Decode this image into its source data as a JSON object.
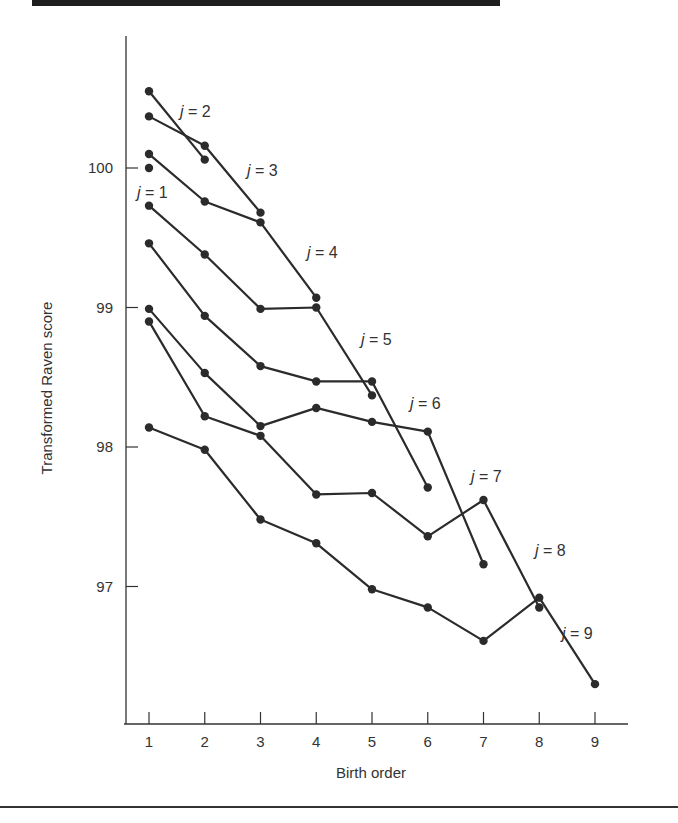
{
  "chart_data": {
    "type": "line",
    "title": "",
    "xlabel": "Birth order",
    "ylabel": "Transformed Raven score",
    "x": [
      1,
      2,
      3,
      4,
      5,
      6,
      7,
      8,
      9
    ],
    "xticks": [
      "1",
      "2",
      "3",
      "4",
      "5",
      "6",
      "7",
      "8",
      "9"
    ],
    "yticks": [
      "97",
      "98",
      "99",
      "100"
    ],
    "ytick_values": [
      97,
      98,
      99,
      100
    ],
    "ylim": [
      96.0,
      100.8
    ],
    "xlim": [
      0.6,
      9.6
    ],
    "grid": false,
    "legend": "none (series labeled inline)",
    "series": [
      {
        "name": "j = 1",
        "x": [
          1
        ],
        "values": [
          100.0
        ]
      },
      {
        "name": "j = 2",
        "x": [
          1,
          2
        ],
        "values": [
          100.55,
          100.06
        ]
      },
      {
        "name": "j = 3",
        "x": [
          1,
          2,
          3
        ],
        "values": [
          100.37,
          100.16,
          99.68
        ]
      },
      {
        "name": "j = 4",
        "x": [
          1,
          2,
          3,
          4
        ],
        "values": [
          100.1,
          99.76,
          99.61,
          99.07
        ]
      },
      {
        "name": "j = 5",
        "x": [
          1,
          2,
          3,
          4,
          5
        ],
        "values": [
          99.73,
          99.38,
          98.99,
          99.0,
          98.37
        ]
      },
      {
        "name": "j = 6",
        "x": [
          1,
          2,
          3,
          4,
          5,
          6
        ],
        "values": [
          99.46,
          98.94,
          98.58,
          98.47,
          98.47,
          97.71
        ]
      },
      {
        "name": "j = 7",
        "x": [
          1,
          2,
          3,
          4,
          5,
          6,
          7
        ],
        "values": [
          98.99,
          98.53,
          98.15,
          98.28,
          98.18,
          98.11,
          97.16
        ]
      },
      {
        "name": "j = 8",
        "x": [
          1,
          2,
          3,
          4,
          5,
          6,
          7,
          8
        ],
        "values": [
          98.9,
          98.22,
          98.08,
          97.66,
          97.67,
          97.36,
          97.62,
          96.85
        ]
      },
      {
        "name": "j = 9",
        "x": [
          1,
          2,
          3,
          4,
          5,
          6,
          7,
          8,
          9
        ],
        "values": [
          98.14,
          97.98,
          97.48,
          97.31,
          96.98,
          96.85,
          96.61,
          96.92,
          96.3
        ]
      }
    ],
    "annotations": [
      {
        "text": "j = 1",
        "near_series": "j = 1"
      },
      {
        "text": "j = 2",
        "near_series": "j = 2"
      },
      {
        "text": "j = 3",
        "near_series": "j = 3"
      },
      {
        "text": "j = 4",
        "near_series": "j = 4"
      },
      {
        "text": "j = 5",
        "near_series": "j = 5"
      },
      {
        "text": "j = 6",
        "near_series": "j = 6"
      },
      {
        "text": "j = 7",
        "near_series": "j = 7"
      },
      {
        "text": "j = 8",
        "near_series": "j = 8"
      },
      {
        "text": "j = 9",
        "near_series": "j = 9"
      }
    ]
  },
  "labels": {
    "xlabel": "Birth order",
    "ylabel": "Transformed Raven score",
    "series_labels": [
      {
        "var": "j",
        "text": " = 1",
        "x": 137,
        "y": 198
      },
      {
        "var": "j",
        "text": " = 2",
        "x": 180,
        "y": 117
      },
      {
        "var": "j",
        "text": " = 3",
        "x": 247,
        "y": 176
      },
      {
        "var": "j",
        "text": " = 4",
        "x": 307,
        "y": 258
      },
      {
        "var": "j",
        "text": " = 5",
        "x": 361,
        "y": 345
      },
      {
        "var": "j",
        "text": " = 6",
        "x": 410,
        "y": 409
      },
      {
        "var": "j",
        "text": " = 7",
        "x": 471,
        "y": 482
      },
      {
        "var": "j",
        "text": " = 8",
        "x": 535,
        "y": 556
      },
      {
        "var": "j",
        "text": " = 9",
        "x": 562,
        "y": 639
      }
    ]
  },
  "colors": {
    "line": "#2b2b2b",
    "text": "#333333",
    "background": "#ffffff",
    "top_band": "#1e1e1e"
  }
}
